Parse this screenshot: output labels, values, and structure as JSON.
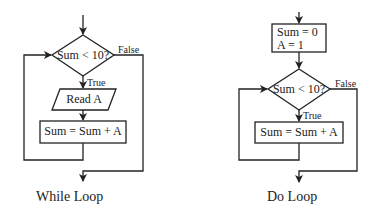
{
  "diagrams": [
    {
      "title": "While Loop",
      "decision": {
        "text": "Sum < 10?",
        "true_label": "True",
        "false_label": "False"
      },
      "steps": [
        {
          "shape": "parallelogram",
          "text": "Read A"
        },
        {
          "shape": "rectangle",
          "text": "Sum = Sum + A"
        }
      ]
    },
    {
      "title": "Do Loop",
      "init": {
        "shape": "rectangle",
        "lines": [
          "Sum = 0",
          "A = 1"
        ]
      },
      "decision": {
        "text": "Sum < 10?",
        "true_label": "True",
        "false_label": "False"
      },
      "steps": [
        {
          "shape": "rectangle",
          "text": "Sum = Sum + A"
        }
      ]
    }
  ],
  "colors": {
    "stroke": "#222222",
    "background": "#ffffff"
  }
}
